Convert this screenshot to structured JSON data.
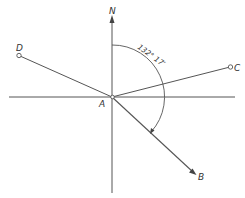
{
  "diagram": {
    "type": "bearing-diagram",
    "colors": {
      "line": "#555555",
      "text": "#333333",
      "background": "#ffffff"
    },
    "origin": {
      "label": "A"
    },
    "north": {
      "label": "N"
    },
    "points": [
      {
        "id": "D",
        "label": "D"
      },
      {
        "id": "C",
        "label": "C"
      },
      {
        "id": "B",
        "label": "B"
      }
    ],
    "angle": {
      "label": "132° 17′",
      "from": "N",
      "to": "B"
    }
  }
}
